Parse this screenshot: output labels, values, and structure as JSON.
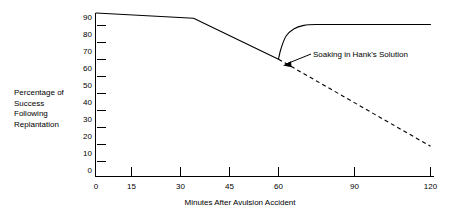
{
  "chart_data": {
    "type": "line",
    "title": "",
    "xlabel": "Minutes After Avulsion Accident",
    "ylabel": "Percentage of\nSuccess\nFollowing\nReplantation",
    "ylabel_lines": [
      "Percentage of",
      "Success",
      "Following",
      "Replantation"
    ],
    "xlim": [
      0,
      120
    ],
    "ylim": [
      0,
      90
    ],
    "grid": false,
    "legend_position": "none",
    "x_ticks": [
      0,
      15,
      30,
      45,
      60,
      90,
      120
    ],
    "x_tick_labels": [
      "0",
      "15",
      "30",
      "45",
      "60",
      "90",
      "120"
    ],
    "y_ticks": [
      0,
      10,
      20,
      30,
      40,
      50,
      60,
      70,
      80,
      90
    ],
    "y_tick_labels": [
      "0",
      "10",
      "20",
      "30",
      "40",
      "50",
      "60",
      "70",
      "80",
      "90"
    ],
    "annotations": [
      {
        "text": "Soaking in Hank's Solution",
        "points_to_x": 60,
        "points_to_y": 66
      }
    ],
    "series": [
      {
        "name": "Untreated decline (solid segment before soaking)",
        "style": "solid",
        "x": [
          0,
          34,
          60
        ],
        "values": [
          92,
          89,
          66
        ]
      },
      {
        "name": "Soaking in Hank's Solution",
        "style": "solid",
        "x": [
          60,
          61,
          63,
          66,
          70,
          75,
          90,
          105,
          120
        ],
        "values": [
          66,
          72,
          79,
          83,
          85,
          85.5,
          85.5,
          85.5,
          85.5
        ]
      },
      {
        "name": "No soaking (projected)",
        "style": "dashed",
        "x": [
          60,
          120
        ],
        "values": [
          66,
          17
        ]
      }
    ]
  }
}
